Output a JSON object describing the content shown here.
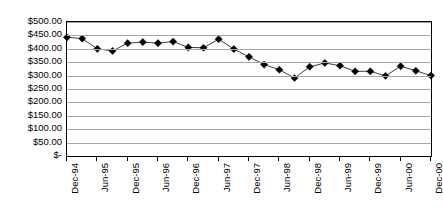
{
  "chart_data": {
    "type": "line",
    "title": "",
    "subtitle": "",
    "xlabel": "",
    "ylabel": "",
    "ylim": [
      0,
      500
    ],
    "ytick_step": 50,
    "grid": true,
    "legend": "none",
    "marker": "diamond",
    "marker_color": "#000000",
    "line_color": "#3f3f3f",
    "ytick_labels": [
      "$500.00",
      "$450.00",
      "$400.00",
      "$350.00",
      "$300.00",
      "$250.00",
      "$200.00",
      "$150.00",
      "$100.00",
      "$50.00",
      "$-"
    ],
    "ytick_values": [
      500,
      450,
      400,
      350,
      300,
      250,
      200,
      150,
      100,
      50,
      0
    ],
    "xtick_labels": [
      "Dec-94",
      "Jun-95",
      "Dec-95",
      "Jun-96",
      "Dec-96",
      "Jun-97",
      "Dec-97",
      "Jun-98",
      "Dec-98",
      "Jun-99",
      "Dec-99",
      "Jun-00",
      "Dec-00"
    ],
    "x": [
      "Dec-94",
      "Mar-95",
      "Jun-95",
      "Sep-95",
      "Dec-95",
      "Mar-96",
      "Jun-96",
      "Sep-96",
      "Dec-96",
      "Mar-97",
      "Jun-97",
      "Sep-97",
      "Dec-97",
      "Mar-98",
      "Jun-98",
      "Sep-98",
      "Dec-98",
      "Mar-99",
      "Jun-99",
      "Sep-99",
      "Dec-99",
      "Mar-00",
      "Jun-00",
      "Sep-00",
      "Dec-00"
    ],
    "values": [
      443,
      438,
      400,
      392,
      421,
      425,
      421,
      427,
      405,
      404,
      436,
      399,
      370,
      341,
      322,
      291,
      333,
      347,
      337,
      316,
      316,
      299,
      335,
      318,
      300
    ],
    "series": [
      {
        "name": "Series 1",
        "values": [
          443,
          438,
          400,
          392,
          421,
          425,
          421,
          427,
          405,
          404,
          436,
          399,
          370,
          341,
          322,
          291,
          333,
          347,
          337,
          316,
          316,
          299,
          335,
          318,
          300
        ]
      }
    ]
  }
}
